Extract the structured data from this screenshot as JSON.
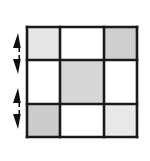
{
  "figure": {
    "canvas": {
      "width": 150,
      "height": 161,
      "background": "#ffffff"
    }
  },
  "grid": {
    "name": "three-by-three-grid",
    "x": 27,
    "y": 27,
    "width": 110,
    "height": 110,
    "rows": 3,
    "columns": 3,
    "line_color": "#1a1a1a",
    "outer_line_width": 2.6,
    "inner_line_width": 2.6,
    "column_edges": [
      27,
      60,
      104,
      137
    ],
    "row_edges": [
      27,
      60,
      104,
      137
    ],
    "cells": [
      {
        "row": 0,
        "col": 0,
        "name": "cell-r0-c0",
        "fill": "#e6e6e6",
        "shade": "light-gray"
      },
      {
        "row": 0,
        "col": 1,
        "name": "cell-r0-c1",
        "fill": "#ffffff",
        "shade": "white"
      },
      {
        "row": 0,
        "col": 2,
        "name": "cell-r0-c2",
        "fill": "#cfcfcf",
        "shade": "medium-gray"
      },
      {
        "row": 1,
        "col": 0,
        "name": "cell-r1-c0",
        "fill": "#ffffff",
        "shade": "white"
      },
      {
        "row": 1,
        "col": 1,
        "name": "cell-r1-c1",
        "fill": "#d6d6d6",
        "shade": "medium-gray"
      },
      {
        "row": 1,
        "col": 2,
        "name": "cell-r1-c2",
        "fill": "#ffffff",
        "shade": "white"
      },
      {
        "row": 2,
        "col": 0,
        "name": "cell-r2-c0",
        "fill": "#cccccc",
        "shade": "medium-gray"
      },
      {
        "row": 2,
        "col": 1,
        "name": "cell-r2-c1",
        "fill": "#ffffff",
        "shade": "white"
      },
      {
        "row": 2,
        "col": 2,
        "name": "cell-r2-c2",
        "fill": "#e8e8e8",
        "shade": "light-gray"
      }
    ]
  },
  "markers": {
    "color": "#111111",
    "groups": [
      {
        "name": "arrow-pair-upper",
        "arrows": [
          {
            "name": "arrow-up-upper",
            "direction": "up",
            "x": 18,
            "tip_y": 33,
            "base_y": 48,
            "half_width": 5
          },
          {
            "name": "arrow-down-upper",
            "direction": "down",
            "x": 18,
            "tip_y": 74,
            "base_y": 59,
            "half_width": 5
          }
        ]
      },
      {
        "name": "arrow-pair-lower",
        "arrows": [
          {
            "name": "arrow-up-lower",
            "direction": "up",
            "x": 18,
            "tip_y": 88,
            "base_y": 103,
            "half_width": 5
          },
          {
            "name": "arrow-down-lower",
            "direction": "down",
            "x": 18,
            "tip_y": 129,
            "base_y": 114,
            "half_width": 5
          }
        ]
      }
    ]
  }
}
